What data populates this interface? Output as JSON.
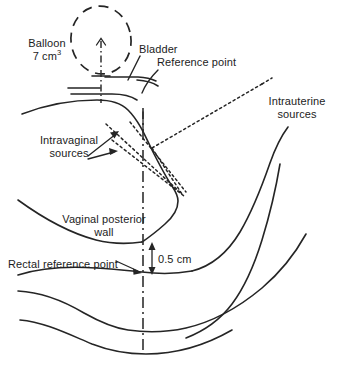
{
  "figure": {
    "type": "medical-anatomy-line-diagram",
    "background_color": "#ffffff",
    "line_color": "#252525",
    "text_color": "#1c1c1c",
    "width": 339,
    "height": 366
  },
  "labels": {
    "balloon_line1": "Balloon",
    "balloon_line2_value": "7 cm",
    "balloon_line2_exponent": "3",
    "bladder": "Bladder",
    "reference_point": "Reference point",
    "intrauterine_line1": "Intrauterine",
    "intrauterine_line2": "sources",
    "intravaginal_line1": "Intravaginal",
    "intravaginal_line2": "sources",
    "vaginal_wall_line1": "Vaginal posterior",
    "vaginal_wall_line2": "wall",
    "rectal_reference_point": "Rectal reference point",
    "distance_measure": "0.5 cm"
  },
  "measurements": {
    "balloon_volume_cm3": 7,
    "rectal_distance_cm": 0.5
  },
  "elements": {
    "balloon_icon": "dashed-ellipse-balloon-icon",
    "catheter_axis_icon": "catheter-axis-icon",
    "central_axis_icon": "central-axis-dashdot-icon",
    "intrauterine_source_icon": "dotted-source-line-icon",
    "intravaginal_source_icon": "dotted-source-line-icon",
    "dimension_arrow_icon": "double-headed-arrow-icon",
    "pointer_arrow_icon": "arrow-pointer-icon",
    "leader_line_icon": "leader-line-icon"
  }
}
